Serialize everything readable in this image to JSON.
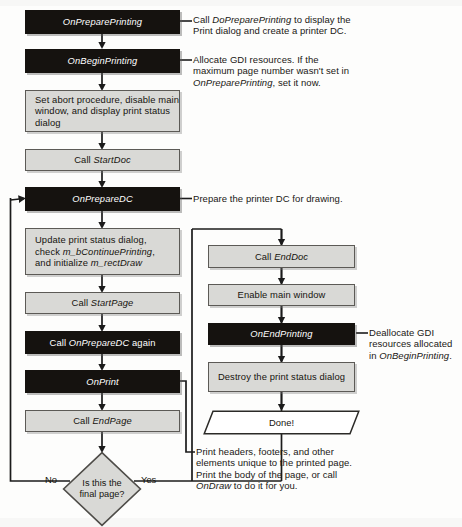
{
  "diagram": {
    "colors": {
      "dark_box_fill": "#15120f",
      "dark_box_text": "#ffffff",
      "grey_box_fill": "#d9d9d6",
      "grey_box_border": "#5c5a56",
      "line": "#1b1b1b",
      "page_background": "#fdfdfc"
    },
    "nodes": {
      "on_prepare_printing": "OnPreparePrinting",
      "on_begin_printing": "OnBeginPrinting",
      "set_abort_procedure": "Set abort procedure, disable main window, and display print status dialog",
      "call_startdoc_pre": "Call ",
      "call_startdoc_fn": "StartDoc",
      "on_prepare_dc": "OnPrepareDC",
      "update_status_l1": "Update print status dialog,",
      "update_status_l2_pre": "check ",
      "update_status_l2_fn": "m_bContinuePrinting",
      "update_status_l2_post": ",",
      "update_status_l3_pre": "and initialize ",
      "update_status_l3_fn": "m_rectDraw",
      "call_startpage_pre": "Call ",
      "call_startpage_fn": "StartPage",
      "call_onpreparedc_again_pre": "Call ",
      "call_onpreparedc_again_fn": "OnPrepareDC",
      "call_onpreparedc_again_post": " again",
      "on_print": "OnPrint",
      "call_endpage_pre": "Call ",
      "call_endpage_fn": "EndPage",
      "decision_l1": "Is this the",
      "decision_l2": "final page?",
      "branch_no": "No",
      "branch_yes": "Yes",
      "call_enddoc_pre": "Call ",
      "call_enddoc_fn": "EndDoc",
      "enable_main_window": "Enable main window",
      "on_end_printing": "OnEndPrinting",
      "destroy_status_dialog": "Destroy the print status dialog",
      "done": "Done!"
    },
    "annotations": {
      "prepare_printing": {
        "l1_pre": "Call ",
        "l1_fn": "DoPreparePrinting",
        "l1_post": " to display the",
        "l2": "Print dialog and create a printer DC."
      },
      "begin_printing": {
        "l1": "Allocate GDI resources. If the",
        "l2": "maximum page number wasn't set in",
        "l3_fn": "OnPreparePrinting",
        "l3_post": ", set it now."
      },
      "prepare_dc": {
        "l1": "Prepare the printer DC for drawing."
      },
      "end_printing": {
        "l1": "Deallocate GDI",
        "l2": "resources allocated",
        "l3_pre": "in ",
        "l3_fn": "OnBeginPrinting",
        "l3_post": "."
      },
      "on_print": {
        "l1": "Print headers, footers, and other",
        "l2": "elements unique to the printed page.",
        "l3": "Print the body of the page, or call",
        "l4_fn": "OnDraw",
        "l4_post": " to do it for you."
      }
    }
  }
}
